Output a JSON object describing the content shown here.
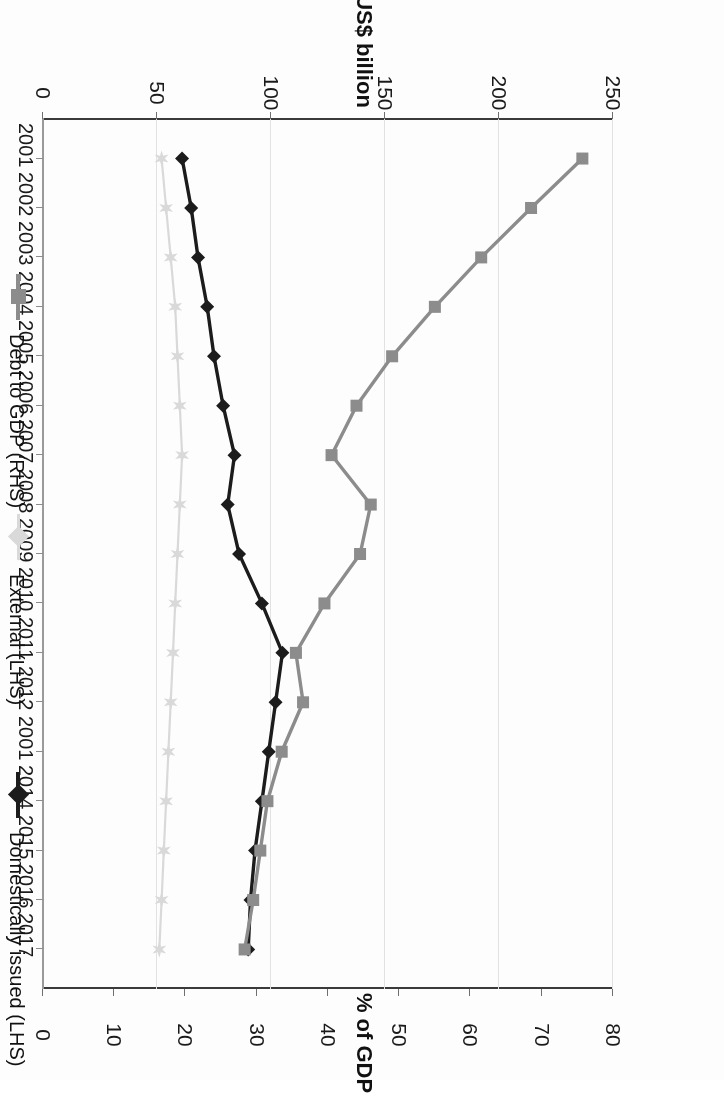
{
  "figure": {
    "orientation": "rotated-180",
    "background": "#ffffff"
  },
  "axes": {
    "left_axis_title": "US$ billion",
    "right_axis_title": "% of GDP",
    "left_ticks": [
      "0",
      "50",
      "100",
      "150",
      "200",
      "250"
    ],
    "right_ticks": [
      "0",
      "10",
      "20",
      "30",
      "40",
      "50",
      "60",
      "70",
      "80"
    ],
    "category_labels": [
      "2001",
      "2002",
      "2003",
      "2004",
      "2005",
      "2006",
      "2007",
      "2008",
      "2009",
      "2010",
      "2011",
      "2012",
      "2001",
      "2014",
      "2015",
      "2016",
      "2017"
    ]
  },
  "legend": {
    "items": [
      {
        "label": "Domestically issued (LHS)",
        "color": "#1c1c1c",
        "marker": "diamond"
      },
      {
        "label": "External (LHS)",
        "color": "#d9d9d9",
        "marker": "star"
      },
      {
        "label": "Debt to GDP (RHS)",
        "color": "#8c8c8c",
        "marker": "square"
      }
    ]
  },
  "chart_data": {
    "type": "line",
    "title": "",
    "subtitle": "",
    "xlabel": "",
    "ylabel": "US$ billion",
    "y2label": "% of GDP",
    "grid": true,
    "legend_position": "bottom",
    "x": [
      "2001",
      "2002",
      "2003",
      "2004",
      "2005",
      "2006",
      "2007",
      "2008",
      "2009",
      "2010",
      "2011",
      "2012",
      "2001",
      "2014",
      "2015",
      "2016",
      "2017"
    ],
    "ylim": [
      0,
      250
    ],
    "y2lim": [
      0,
      80
    ],
    "series": [
      {
        "name": "Domestically issued (LHS)",
        "axis": "left",
        "units": "US$ billion",
        "color": "#1c1c1c",
        "marker": "diamond",
        "values": [
          61,
          65,
          68,
          72,
          75,
          79,
          84,
          81,
          86,
          96,
          105,
          102,
          99,
          96,
          93,
          91,
          90
        ]
      },
      {
        "name": "External (LHS)",
        "axis": "left",
        "units": "US$ billion",
        "color": "#d9d9d9",
        "marker": "star",
        "values": [
          52,
          54,
          56,
          58,
          59,
          60,
          61,
          60,
          59,
          58,
          57,
          56,
          55,
          54,
          53,
          52,
          51
        ]
      },
      {
        "name": "Debt to GDP (RHS)",
        "axis": "right",
        "units": "% of GDP",
        "color": "#8c8c8c",
        "marker": "square",
        "values": [
          75.7,
          68.5,
          61.5,
          55.0,
          49.0,
          44.0,
          40.5,
          46.0,
          44.5,
          39.5,
          35.5,
          36.5,
          33.5,
          31.5,
          30.5,
          29.5,
          28.3
        ]
      }
    ]
  }
}
